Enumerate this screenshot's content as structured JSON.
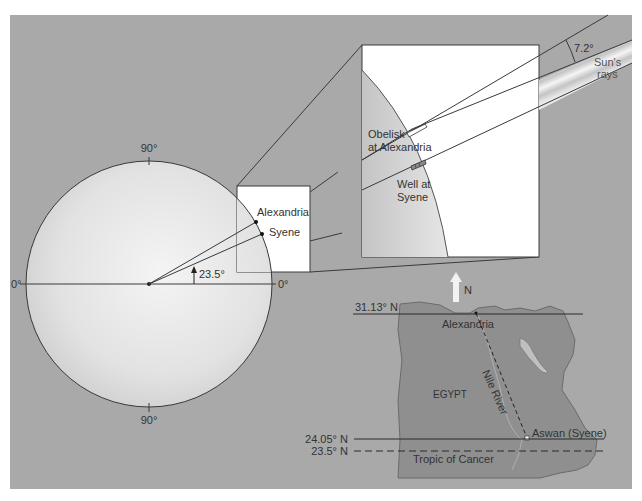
{
  "figure": {
    "background_color": "#a9a9a9",
    "earth_circle": {
      "label_top": "90°",
      "label_bottom": "90°",
      "label_left": "0°",
      "label_right": "0°",
      "angle_label": "23.5°",
      "city_labels": [
        "Alexandria",
        "Syene"
      ]
    },
    "detail_inset": {
      "obelisk_label_line1": "Obelisk",
      "obelisk_label_line2": "at Alexandria",
      "well_label_line1": "Well at",
      "well_label_line2": "Syene",
      "angle_label": "7.2°",
      "rays_label_line1": "Sun's",
      "rays_label_line2": "rays"
    },
    "map": {
      "north_label": "N",
      "country_label": "EGYPT",
      "river_label": "Nile River",
      "city_north": "Alexandria",
      "city_south": "Aswan (Syene)",
      "latitude_north": "31.13° N",
      "latitude_south": "24.05° N",
      "tropic_latitude": "23.5° N",
      "tropic_label": "Tropic of Cancer"
    }
  }
}
